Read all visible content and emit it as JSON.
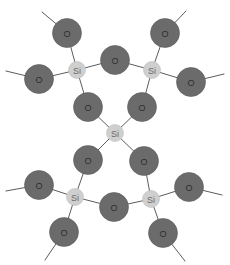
{
  "diagram": {
    "title": "",
    "colors": {
      "oxygen_fill": "#6b6b6b",
      "silicon_fill": "#cfcfcf",
      "bond": "#5c5c5c",
      "background": "#ffffff"
    },
    "atom_labels": {
      "oxygen": "O",
      "silicon": "Si"
    },
    "atoms": [
      {
        "id": "si_left_top",
        "element": "Si",
        "x": 77,
        "y": 70
      },
      {
        "id": "si_right_top",
        "element": "Si",
        "x": 152,
        "y": 70
      },
      {
        "id": "si_center",
        "element": "Si",
        "x": 115,
        "y": 133
      },
      {
        "id": "si_left_bot",
        "element": "Si",
        "x": 75,
        "y": 197
      },
      {
        "id": "si_right_bot",
        "element": "Si",
        "x": 151,
        "y": 199
      },
      {
        "id": "o_tl",
        "element": "O",
        "x": 67,
        "y": 33
      },
      {
        "id": "o_tr",
        "element": "O",
        "x": 165,
        "y": 33
      },
      {
        "id": "o_l1",
        "element": "O",
        "x": 39,
        "y": 79
      },
      {
        "id": "o_r1",
        "element": "O",
        "x": 191,
        "y": 82
      },
      {
        "id": "o_bridge_top",
        "element": "O",
        "x": 115,
        "y": 60
      },
      {
        "id": "o_ml_up",
        "element": "O",
        "x": 88,
        "y": 107
      },
      {
        "id": "o_mr_up",
        "element": "O",
        "x": 142,
        "y": 107
      },
      {
        "id": "o_ml_lo",
        "element": "O",
        "x": 88,
        "y": 160
      },
      {
        "id": "o_mr_lo",
        "element": "O",
        "x": 144,
        "y": 161
      },
      {
        "id": "o_l2",
        "element": "O",
        "x": 39,
        "y": 185
      },
      {
        "id": "o_r2",
        "element": "O",
        "x": 189,
        "y": 187
      },
      {
        "id": "o_bridge_bot",
        "element": "O",
        "x": 114,
        "y": 207
      },
      {
        "id": "o_bl",
        "element": "O",
        "x": 64,
        "y": 232
      },
      {
        "id": "o_br",
        "element": "O",
        "x": 163,
        "y": 233
      }
    ],
    "bonds": [
      [
        "si_left_top",
        "o_tl"
      ],
      [
        "si_left_top",
        "o_l1"
      ],
      [
        "si_left_top",
        "o_bridge_top"
      ],
      [
        "si_left_top",
        "o_ml_up"
      ],
      [
        "si_right_top",
        "o_tr"
      ],
      [
        "si_right_top",
        "o_r1"
      ],
      [
        "si_right_top",
        "o_bridge_top"
      ],
      [
        "si_right_top",
        "o_mr_up"
      ],
      [
        "si_center",
        "o_ml_up"
      ],
      [
        "si_center",
        "o_mr_up"
      ],
      [
        "si_center",
        "o_ml_lo"
      ],
      [
        "si_center",
        "o_mr_lo"
      ],
      [
        "si_left_bot",
        "o_ml_lo"
      ],
      [
        "si_left_bot",
        "o_l2"
      ],
      [
        "si_left_bot",
        "o_bridge_bot"
      ],
      [
        "si_left_bot",
        "o_bl"
      ],
      [
        "si_right_bot",
        "o_mr_lo"
      ],
      [
        "si_right_bot",
        "o_r2"
      ],
      [
        "si_right_bot",
        "o_bridge_bot"
      ],
      [
        "si_right_bot",
        "o_br"
      ]
    ],
    "dangling_bonds": [
      {
        "from": "o_tl",
        "x2": 42,
        "y2": 12
      },
      {
        "from": "o_tr",
        "x2": 186,
        "y2": 11
      },
      {
        "from": "o_l1",
        "x2": 6,
        "y2": 71
      },
      {
        "from": "o_r1",
        "x2": 224,
        "y2": 74
      },
      {
        "from": "o_l2",
        "x2": 6,
        "y2": 191
      },
      {
        "from": "o_r2",
        "x2": 222,
        "y2": 195
      },
      {
        "from": "o_bl",
        "x2": 45,
        "y2": 260
      },
      {
        "from": "o_br",
        "x2": 185,
        "y2": 261
      }
    ],
    "radii": {
      "oxygen": 14.5,
      "silicon": 8.5
    }
  }
}
